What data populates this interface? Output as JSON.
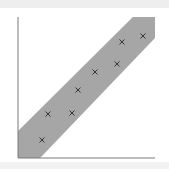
{
  "colors": {
    "background": "#ffffff",
    "frame_strip": "#eeeeee",
    "band": "#a6a6a6",
    "axis": "#7a7a7a",
    "marker": "#333333"
  },
  "chart_data": {
    "type": "scatter",
    "title": "",
    "xlabel": "",
    "ylabel": "",
    "xlim": [
      0,
      10
    ],
    "ylim": [
      0,
      10
    ],
    "grid": false,
    "legend": null,
    "marker": "x",
    "series": [
      {
        "name": "points",
        "x": [
          1.75,
          2.19,
          3.94,
          4.38,
          5.62,
          7.23,
          7.59,
          9.12
        ],
        "y": [
          1.28,
          3.12,
          3.19,
          4.82,
          6.1,
          6.67,
          8.23,
          8.65
        ]
      }
    ],
    "band": {
      "description": "shaded diagonal confidence band along y = x",
      "upper": [
        [
          0,
          1.92
        ],
        [
          8.39,
          10
        ],
        [
          10,
          10
        ]
      ],
      "lower": [
        [
          1.61,
          0
        ],
        [
          10,
          8.51
        ],
        [
          10,
          10
        ]
      ]
    }
  }
}
